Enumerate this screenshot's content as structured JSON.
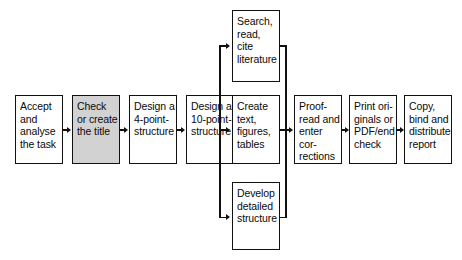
{
  "diagram": {
    "style": {
      "line_color": "#111111",
      "box_fill": "#ffffff",
      "highlight_fill": "#d2d2d2",
      "text_color": "#0a0a0a",
      "background": "#ffffff"
    },
    "nodes": [
      {
        "id": "accept-task",
        "label": "Accept\nand\nanalyse\nthe task",
        "highlighted": false,
        "x": 15,
        "y": 95,
        "w": 48,
        "h": 69
      },
      {
        "id": "check-title",
        "label": "Check\nor create\nthe title",
        "highlighted": true,
        "x": 72,
        "y": 95,
        "w": 48,
        "h": 69
      },
      {
        "id": "four-point-structure",
        "label": "Design a\n4-point-\nstructure",
        "highlighted": false,
        "x": 129,
        "y": 95,
        "w": 48,
        "h": 69
      },
      {
        "id": "ten-point-structure",
        "label": "Design a\n10-point-\nstructure",
        "highlighted": false,
        "x": 186,
        "y": 95,
        "w": 48,
        "h": 69
      },
      {
        "id": "search-literature",
        "label": "Search,\nread,\ncite\nliterature",
        "highlighted": false,
        "x": 232,
        "y": 10,
        "w": 48,
        "h": 72
      },
      {
        "id": "create-text",
        "label": "Create\ntext,\nfigures,\ntables",
        "highlighted": false,
        "x": 232,
        "y": 95,
        "w": 48,
        "h": 69
      },
      {
        "id": "develop-structure",
        "label": "Develop\ndetailed\nstructure",
        "highlighted": false,
        "x": 232,
        "y": 182,
        "w": 48,
        "h": 68
      },
      {
        "id": "proofread",
        "label": "Proof-\nread and\nenter cor-\nrections",
        "highlighted": false,
        "x": 294,
        "y": 95,
        "w": 48,
        "h": 69
      },
      {
        "id": "print-originals",
        "label": "Print ori-\nginals or\nPDF/end\ncheck",
        "highlighted": false,
        "x": 349,
        "y": 95,
        "w": 48,
        "h": 69
      },
      {
        "id": "copy-distribute",
        "label": "Copy,\nbind and\ndistribute\nreport",
        "highlighted": false,
        "x": 404,
        "y": 95,
        "w": 48,
        "h": 69
      }
    ],
    "connectors": [
      {
        "id": "accept-to-check",
        "from": "accept-task",
        "to": "check-title"
      },
      {
        "id": "check-to-four",
        "from": "check-title",
        "to": "four-point-structure"
      },
      {
        "id": "four-to-ten",
        "from": "four-point-structure",
        "to": "ten-point-structure"
      },
      {
        "id": "ten-to-split",
        "from": "ten-point-structure",
        "to": "branch-split"
      },
      {
        "id": "split-to-search",
        "from": "branch-split",
        "to": "search-literature"
      },
      {
        "id": "split-to-create",
        "from": "branch-split",
        "to": "create-text"
      },
      {
        "id": "split-to-develop",
        "from": "branch-split",
        "to": "develop-structure"
      },
      {
        "id": "search-to-merge",
        "from": "search-literature",
        "to": "branch-merge"
      },
      {
        "id": "create-to-merge",
        "from": "create-text",
        "to": "branch-merge"
      },
      {
        "id": "develop-to-merge",
        "from": "develop-structure",
        "to": "branch-merge"
      },
      {
        "id": "merge-to-proofread",
        "from": "branch-merge",
        "to": "proofread"
      },
      {
        "id": "proofread-to-print",
        "from": "proofread",
        "to": "print-originals"
      },
      {
        "id": "print-to-copy",
        "from": "print-originals",
        "to": "copy-distribute"
      }
    ]
  }
}
